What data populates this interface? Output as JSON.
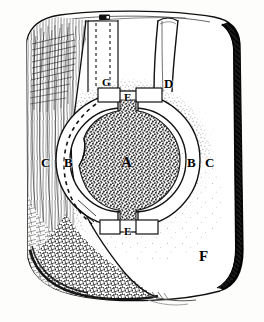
{
  "figure": {
    "kind": "engraving-diagram",
    "palette": {
      "paper": "#fdfdfb",
      "ink": "#111111",
      "core_fill": "#4a4a4a",
      "ring_fill": "#ffffff",
      "stipple": "#2b2b2b",
      "shadow": "#000000"
    },
    "labels": [
      {
        "id": "A",
        "text": "A",
        "x": 128,
        "y": 163,
        "size": "big",
        "region": "core",
        "on_dark": true
      },
      {
        "id": "B-left",
        "text": "B",
        "x": 68,
        "y": 163,
        "size": "med",
        "region": "inner-ring-left",
        "on_dark": false
      },
      {
        "id": "C-left",
        "text": "C",
        "x": 45,
        "y": 163,
        "size": "med",
        "region": "outer-zone-left",
        "on_dark": false
      },
      {
        "id": "B-right",
        "text": "B",
        "x": 191,
        "y": 163,
        "size": "med",
        "region": "inner-ring-right",
        "on_dark": false
      },
      {
        "id": "C-right",
        "text": "C",
        "x": 209,
        "y": 163,
        "size": "med",
        "region": "outer-zone-right",
        "on_dark": false
      },
      {
        "id": "D",
        "text": "D",
        "x": 167,
        "y": 84,
        "size": "med",
        "region": "right-channel",
        "on_dark": false
      },
      {
        "id": "E-top",
        "text": "E",
        "x": 127,
        "y": 97,
        "size": "sm",
        "region": "top-notch",
        "on_dark": false
      },
      {
        "id": "E-bottom",
        "text": "E",
        "x": 127,
        "y": 232,
        "size": "sm",
        "region": "bottom-notch",
        "on_dark": false
      },
      {
        "id": "F",
        "text": "F",
        "x": 203,
        "y": 257,
        "size": "big",
        "region": "lower-right-face",
        "on_dark": false
      },
      {
        "id": "G",
        "text": "G",
        "x": 105,
        "y": 83,
        "size": "sm",
        "region": "left-channel",
        "on_dark": false
      }
    ],
    "parts": {
      "core_label": "A",
      "ring_label": "B",
      "halo_label": "C",
      "right_channel_label": "D",
      "notch_label": "E",
      "face_label": "F",
      "left_channel_label": "G"
    },
    "features": {
      "core": {
        "cx": 128,
        "cy": 160,
        "r": 50
      },
      "ring_outer_r": 66,
      "ring_inner_r": 52,
      "halo_outer_r": 92,
      "dashed_arc": true,
      "top_plug": true,
      "left_channel_dashed": true,
      "right_channel_solid": true,
      "left_grain_hatching": true,
      "bottom_left_crosshatch": true,
      "right_edge_dark_band": true
    }
  }
}
